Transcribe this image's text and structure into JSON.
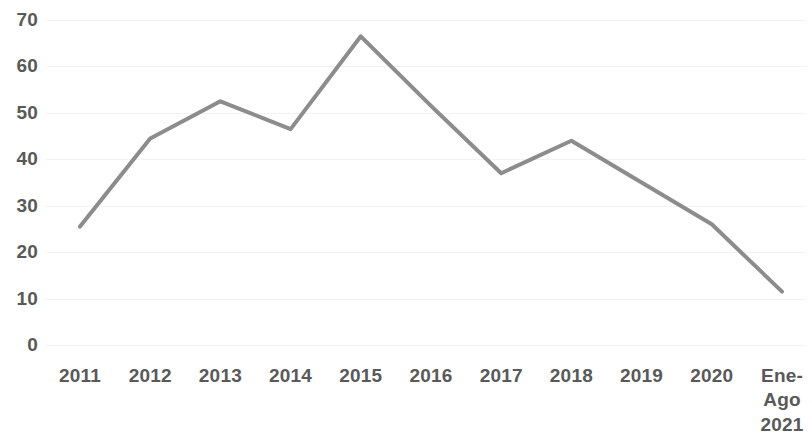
{
  "chart_data": {
    "type": "line",
    "title": "",
    "subtitle": "",
    "xlabel": "",
    "ylabel": "",
    "categories": [
      "2011",
      "2012",
      "2013",
      "2014",
      "2015",
      "2016",
      "2017",
      "2018",
      "2019",
      "2020",
      "Ene-\nAgo\n2021"
    ],
    "values": [
      25.5,
      44.5,
      52.5,
      46.5,
      66.5,
      51.5,
      37,
      44,
      35,
      26,
      11.5
    ],
    "series": [
      {
        "name": "",
        "values": [
          25.5,
          44.5,
          52.5,
          46.5,
          66.5,
          51.5,
          37,
          44,
          35,
          26,
          11.5
        ]
      }
    ],
    "ylim": [
      0,
      70
    ],
    "y_ticks": [
      "0",
      "10",
      "20",
      "30",
      "40",
      "50",
      "60",
      "70"
    ],
    "y_tick_values": [
      0,
      10,
      20,
      30,
      40,
      50,
      60,
      70
    ],
    "grid": true,
    "grid_axis": "y",
    "legend": false,
    "legend_position": "none",
    "markers": false,
    "line_color": "#8c8c8c",
    "line_width": 4,
    "axis_label_color": "#595959",
    "gridline_color": "#f2f2f2",
    "background_color": "#ffffff",
    "annotations": []
  }
}
